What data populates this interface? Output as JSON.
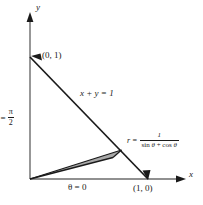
{
  "figure": {
    "type": "math-diagram",
    "axes": {
      "y_label": "y",
      "x_label": "x",
      "origin_px": [
        30,
        179
      ],
      "x_axis_end_px": [
        186,
        179
      ],
      "y_axis_end_px": [
        30,
        14
      ]
    },
    "points": [
      {
        "name": "y-intercept",
        "label": "(0, 1)",
        "px": [
          30,
          57
        ]
      },
      {
        "name": "x-intercept",
        "label": "(1, 0)",
        "px": [
          148,
          179
        ]
      }
    ],
    "labels": {
      "line_equation": "x + y = 1",
      "theta_zero": "θ = 0",
      "theta_half_pi_lhs": "θ =",
      "theta_half_pi_num": "π",
      "theta_half_pi_den": "2",
      "r_lhs": "r =",
      "r_numerator": "1",
      "r_denominator_sin": "sin",
      "r_denominator_theta1": "θ",
      "r_denominator_plus": "+",
      "r_denominator_cos": "cos",
      "r_denominator_theta2": "θ"
    },
    "caption": "",
    "colors": {
      "ink": "#1a1a1a",
      "axis": "#555555",
      "wedge_fill": "#a8a8a8",
      "wedge_edge": "#1a1a1a",
      "background": "#ffffff"
    },
    "wedge": {
      "description": "thin shaded sector from origin to the line x + y = 1",
      "apex_px": [
        30,
        179
      ],
      "outer_upper_px": [
        121,
        150
      ],
      "outer_lower_px": [
        113,
        157
      ]
    }
  }
}
